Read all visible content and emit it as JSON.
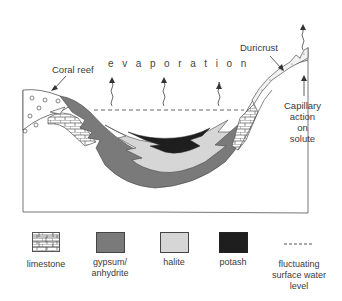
{
  "diagram": {
    "labels": {
      "coral_reef": "Coral reef",
      "evaporation": "evaporation",
      "duricrust": "Duricrust",
      "capillary": [
        "Capillary",
        "action",
        "on",
        "solute"
      ]
    },
    "colors": {
      "gypsum_anhydrite": "#7a7a7a",
      "halite": "#d6d6d6",
      "potash": "#1e1e1e",
      "outline": "#444444"
    }
  },
  "legend": {
    "items": [
      {
        "key": "limestone",
        "label": "limestone",
        "swatch": "brick-pattern"
      },
      {
        "key": "gypsum",
        "label_line1": "gypsum/",
        "label_line2": "anhydrite",
        "swatch": "#7a7a7a"
      },
      {
        "key": "halite",
        "label": "halite",
        "swatch": "#d6d6d6"
      },
      {
        "key": "potash",
        "label": "potash",
        "swatch": "#1e1e1e"
      },
      {
        "key": "water_level",
        "label_line1": "fluctuating",
        "label_line2": "surface water",
        "label_line3": "level",
        "swatch": "dashed-line"
      }
    ]
  }
}
